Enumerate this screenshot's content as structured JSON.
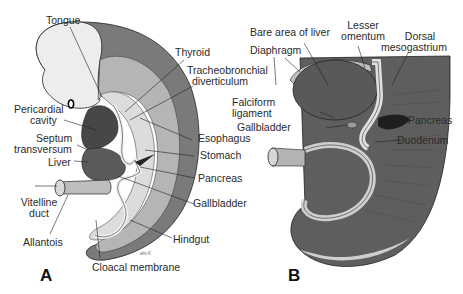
{
  "figure": {
    "panels": [
      {
        "id": "A",
        "letter": "A",
        "labels": {
          "tongue": "Tongue",
          "thyroid": "Thyroid",
          "tracheo_1": "Tracheobronchial",
          "tracheo_2": "diverticulum",
          "pericardial_1": "Pericardial",
          "pericardial_2": "cavity",
          "septum_1": "Septum",
          "septum_2": "transversum",
          "liver": "Liver",
          "esophagus": "Esophagus",
          "stomach": "Stomach",
          "pancreas": "Pancreas",
          "gallbladder": "Gallbladder",
          "vitelline_1": "Vitelline",
          "vitelline_2": "duct",
          "allantois": "Allantois",
          "hindgut": "Hindgut",
          "cloacal": "Cloacal membrane",
          "signature": "als-K"
        }
      },
      {
        "id": "B",
        "letter": "B",
        "labels": {
          "bare_area": "Bare area of liver",
          "lesser_1": "Lesser",
          "lesser_2": "omentum",
          "dorsal_1": "Dorsal",
          "dorsal_2": "mesogastrium",
          "diaphragm": "Diaphragm",
          "falciform_1": "Falciform",
          "falciform_2": "ligament",
          "gallbladder": "Gallbladder",
          "pancreas": "Pancreas",
          "duodenum": "Duodenum"
        }
      }
    ],
    "colors": {
      "outer_wall": "#6e6e6e",
      "mid_layer": "#a9a9a9",
      "light_layer": "#d6d6d6",
      "pale": "#ececec",
      "dark_organ": "#4a4a4a",
      "darker": "#2f2f2f",
      "line": "#222222"
    }
  }
}
